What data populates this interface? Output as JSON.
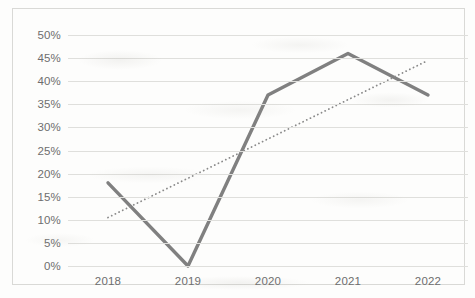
{
  "chart_data": {
    "type": "line",
    "title": "",
    "xlabel": "",
    "ylabel": "",
    "categories": [
      "2018",
      "2019",
      "2020",
      "2021",
      "2022"
    ],
    "ylim": [
      0,
      50
    ],
    "yticks": [
      "0%",
      "5%",
      "10%",
      "15%",
      "20%",
      "25%",
      "30%",
      "35%",
      "40%",
      "45%",
      "50%"
    ],
    "ytick_values": [
      0,
      5,
      10,
      15,
      20,
      25,
      30,
      35,
      40,
      45,
      50
    ],
    "grid": true,
    "legend": "none",
    "series": [
      {
        "name": "data-series",
        "style": "solid",
        "color": "#808080",
        "values": [
          18,
          0,
          37,
          46,
          37
        ]
      },
      {
        "name": "trendline",
        "style": "dotted",
        "color": "#8a8a8a",
        "values": [
          10.5,
          19,
          27.5,
          36,
          44.5
        ]
      }
    ]
  },
  "colors": {
    "line": "#808080",
    "trendline": "#8a8a8a",
    "gridline": "#dfdfdc",
    "border": "#d9d9d6",
    "tick_label": "#6e6e6e",
    "background": "#fdfdfc"
  }
}
